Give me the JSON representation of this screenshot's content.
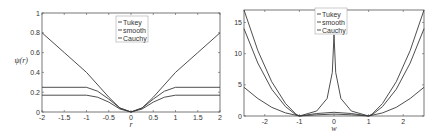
{
  "chart_data": [
    {
      "type": "line",
      "title": "",
      "xlabel": "r",
      "ylabel": "ψ(r)",
      "xlim": [
        -2,
        2
      ],
      "ylim": [
        0,
        1
      ],
      "xticks": [
        "-2",
        "-1.5",
        "-1",
        "-0.5",
        "0",
        "0.5",
        "1",
        "1.5",
        "2"
      ],
      "yticks": [
        "0",
        "0.2",
        "0.4",
        "0.6",
        "0.8",
        "1"
      ],
      "grid": false,
      "legend": {
        "position": "upper center",
        "entries": [
          "Tukey",
          "smooth",
          "Cauchy"
        ]
      },
      "series": [
        {
          "name": "Tukey",
          "x": [
            -2,
            -1,
            -0.75,
            -0.5,
            -0.25,
            0,
            0.25,
            0.5,
            0.75,
            1,
            2
          ],
          "values": [
            0.25,
            0.25,
            0.21,
            0.13,
            0.04,
            0,
            0.04,
            0.13,
            0.21,
            0.25,
            0.25
          ]
        },
        {
          "name": "smooth",
          "x": [
            -2,
            -1,
            -0.75,
            -0.5,
            -0.25,
            0,
            0.25,
            0.5,
            0.75,
            1,
            2
          ],
          "values": [
            0.17,
            0.17,
            0.15,
            0.1,
            0.03,
            0,
            0.03,
            0.1,
            0.15,
            0.17,
            0.17
          ]
        },
        {
          "name": "Cauchy",
          "x": [
            -2,
            -1.5,
            -1,
            -0.5,
            -0.25,
            0,
            0.25,
            0.5,
            1,
            1.5,
            2
          ],
          "values": [
            0.8,
            0.6,
            0.4,
            0.15,
            0.04,
            0,
            0.04,
            0.15,
            0.4,
            0.6,
            0.8
          ]
        }
      ]
    },
    {
      "type": "line",
      "title": "",
      "xlabel": "w",
      "ylabel": "",
      "xlim": [
        -2.6,
        2.6
      ],
      "ylim": [
        0,
        17
      ],
      "xticks": [
        "-2",
        "-1",
        "0",
        "1",
        "2"
      ],
      "yticks": [
        "0",
        "5",
        "10",
        "15"
      ],
      "grid": false,
      "legend": {
        "position": "upper center",
        "entries": [
          "Tukey",
          "smooth",
          "Cauchy"
        ]
      },
      "series": [
        {
          "name": "Tukey",
          "x": [
            -2.6,
            -2.2,
            -1.8,
            -1.4,
            -1.1,
            -1,
            -0.5,
            0,
            0.5,
            1,
            1.1,
            1.4,
            1.8,
            2.2,
            2.6
          ],
          "values": [
            17,
            10.5,
            5.5,
            2,
            0.3,
            0,
            0.4,
            0.6,
            0.4,
            0,
            0.3,
            2,
            5.5,
            10.5,
            17
          ]
        },
        {
          "name": "smooth",
          "x": [
            -2.6,
            -2.2,
            -1.8,
            -1.4,
            -1.1,
            -1,
            -0.5,
            -0.2,
            -0.05,
            0,
            0.05,
            0.2,
            0.5,
            1,
            1.1,
            1.4,
            1.8,
            2.2,
            2.6
          ],
          "values": [
            14,
            8.5,
            4.3,
            1.5,
            0.2,
            0,
            0.8,
            2.8,
            7,
            13,
            7,
            2.8,
            0.8,
            0,
            0.2,
            1.5,
            4.3,
            8.5,
            14
          ]
        },
        {
          "name": "Cauchy",
          "x": [
            -2.6,
            -2.2,
            -1.8,
            -1.4,
            -1,
            -0.5,
            0,
            0.5,
            1,
            1.4,
            1.8,
            2.2,
            2.6
          ],
          "values": [
            4.6,
            2.8,
            1.4,
            0.5,
            0,
            0.2,
            0.3,
            0.2,
            0,
            0.5,
            1.4,
            2.8,
            4.6
          ]
        }
      ]
    }
  ],
  "plots": [
    {
      "frame": {
        "x0": 42,
        "y0": 13,
        "x1": 220,
        "y1": 112
      },
      "xtick_values": [
        -2,
        -1.5,
        -1,
        -0.5,
        0,
        0.5,
        1,
        1.5,
        2
      ],
      "ytick_values": [
        0,
        0.2,
        0.4,
        0.6,
        0.8,
        1
      ],
      "legend_box": {
        "x": 116,
        "y": 16
      }
    },
    {
      "frame": {
        "x0": 244,
        "y0": 10,
        "x1": 424,
        "y1": 116
      },
      "xtick_values": [
        -2,
        -1,
        0,
        1,
        2
      ],
      "ytick_values": [
        0,
        5,
        10,
        15
      ],
      "legend_box": {
        "x": 315,
        "y": 8
      }
    }
  ],
  "colors": {
    "line": "#3a3a3a",
    "axis": "#555555"
  }
}
